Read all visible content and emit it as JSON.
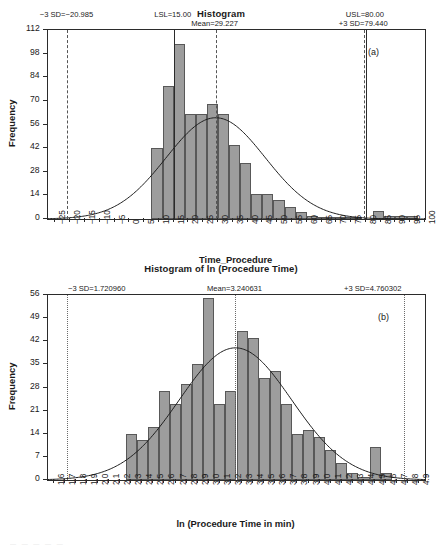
{
  "figure": {
    "panel_a_letter": "(a)",
    "panel_b_letter": "(b)"
  },
  "chart_data": [
    {
      "id": "histogram_time_procedure",
      "type": "bar",
      "title": "Histogram",
      "xlabel": "Time_Procedure",
      "ylabel": "Frequency",
      "xlim": [
        -27.5,
        100
      ],
      "ylim": [
        0,
        112
      ],
      "yticks": [
        0,
        14,
        28,
        42,
        56,
        70,
        84,
        98,
        112
      ],
      "xticks": [
        -25,
        -20,
        -15,
        -10,
        -5,
        0,
        5,
        10,
        15,
        20,
        25,
        30,
        35,
        40,
        45,
        50,
        55,
        60,
        65,
        70,
        75,
        80,
        85,
        90,
        95,
        100
      ],
      "grid": false,
      "bin_width": 3.75,
      "bin_starts": [
        7.5,
        11.25,
        15,
        18.75,
        22.5,
        26.25,
        30,
        33.75,
        37.5,
        41.25,
        45,
        48.75,
        52.5,
        56.25,
        60,
        63.75,
        67.5,
        71.25,
        75,
        82.5,
        86.25,
        90,
        93.75
      ],
      "values": [
        42,
        79,
        104,
        62,
        62,
        68,
        62,
        44,
        33,
        15,
        15,
        11,
        7,
        4,
        2,
        1,
        1,
        1,
        1,
        5,
        2,
        2,
        2
      ],
      "overlay_curve": {
        "type": "normal",
        "mean": 29.227,
        "sd": 16.738,
        "peak_frequency": 60
      },
      "annotations": [
        {
          "name": "minus_3_sd",
          "label": "−3 SD=−20.985",
          "value": -20.985,
          "style": "dashed",
          "label_align": "center"
        },
        {
          "name": "lsl",
          "label": "LSL=15.00",
          "value": 15.0,
          "style": "solid",
          "label_align": "center"
        },
        {
          "name": "mean",
          "label": "Mean=29.227",
          "value": 29.227,
          "style": "dashed",
          "label_align": "center"
        },
        {
          "name": "usl",
          "label": "USL=80.00",
          "value": 80.0,
          "style": "solid",
          "label_align": "center"
        },
        {
          "name": "plus_3_sd",
          "label": "+3 SD=79.440",
          "value": 79.44,
          "style": "dashed",
          "label_align": "center"
        }
      ]
    },
    {
      "id": "histogram_ln_procedure_time",
      "type": "bar",
      "title": "Histogram of ln (Procedure Time)",
      "xlabel": "ln (Procedure Time in min)",
      "ylabel": "Frequency",
      "xlim": [
        1.55,
        4.95
      ],
      "ylim": [
        0,
        56
      ],
      "yticks": [
        0,
        7,
        14,
        21,
        28,
        35,
        42,
        49,
        56
      ],
      "xticks": [
        1.6,
        1.7,
        1.8,
        1.9,
        2.0,
        2.1,
        2.2,
        2.3,
        2.4,
        2.5,
        2.6,
        2.7,
        2.8,
        2.9,
        3.0,
        3.1,
        3.2,
        3.3,
        3.4,
        3.5,
        3.6,
        3.7,
        3.8,
        3.9,
        4.0,
        4.1,
        4.2,
        4.3,
        4.4,
        4.5,
        4.6,
        4.7,
        4.8,
        4.9
      ],
      "grid": false,
      "bin_width": 0.1,
      "bin_starts": [
        2.25,
        2.35,
        2.45,
        2.55,
        2.65,
        2.75,
        2.85,
        2.95,
        3.05,
        3.15,
        3.25,
        3.35,
        3.45,
        3.55,
        3.65,
        3.75,
        3.85,
        3.95,
        4.05,
        4.15,
        4.25,
        4.35,
        4.45,
        4.55
      ],
      "values": [
        14,
        12,
        16,
        27,
        23,
        29,
        35,
        55,
        23,
        27,
        45,
        43,
        31,
        33,
        23,
        14,
        15,
        13,
        9,
        5,
        2,
        1,
        10,
        2
      ],
      "overlay_curve": {
        "type": "normal",
        "mean": 3.240631,
        "sd": 0.506557,
        "peak_frequency": 40
      },
      "annotations": [
        {
          "name": "minus_3_sd",
          "label": "−3 SD=1.720960",
          "value": 1.72096,
          "style": "dotted",
          "label_align": "left"
        },
        {
          "name": "mean",
          "label": "Mean=3.240631",
          "value": 3.240631,
          "style": "dotted",
          "label_align": "center"
        },
        {
          "name": "plus_3_sd",
          "label": "+3 SD=4.760302",
          "value": 4.760302,
          "style": "dotted",
          "label_align": "right"
        }
      ]
    }
  ]
}
